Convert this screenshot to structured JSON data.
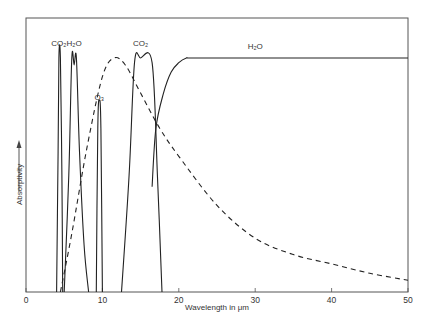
{
  "chart_data": {
    "type": "line",
    "title": "",
    "xlabel": "Wavelength in μm",
    "ylabel": "Absorptivity",
    "xlim": [
      0,
      50
    ],
    "ylim": [
      0,
      1.15
    ],
    "x_ticks": [
      "0",
      "10",
      "20",
      "30",
      "40",
      "50"
    ],
    "grid": false,
    "legend": "none (bands annotated directly)",
    "annotations": [
      {
        "text": "CO₂",
        "x": 4.3,
        "y": 1.05
      },
      {
        "text": "H₂O",
        "x": 6.3,
        "y": 1.05
      },
      {
        "text": "O₃",
        "x": 9.6,
        "y": 0.82
      },
      {
        "text": "CO₂",
        "x": 15.0,
        "y": 1.05
      },
      {
        "text": "H₂O",
        "x": 30,
        "y": 1.04
      }
    ],
    "series": [
      {
        "name": "CO2 band (4.3 μm)",
        "style": "solid",
        "x": [
          4.0,
          4.2,
          4.3,
          4.5,
          4.7,
          4.8
        ],
        "y": [
          0,
          0.6,
          1.0,
          1.0,
          0.5,
          0
        ]
      },
      {
        "name": "H2O band (6.3 μm)",
        "style": "solid",
        "x": [
          5.0,
          5.6,
          6.0,
          6.3,
          6.6,
          7.0,
          7.6,
          8.2
        ],
        "y": [
          0,
          0.5,
          1.0,
          0.97,
          1.0,
          0.6,
          0.2,
          0
        ]
      },
      {
        "name": "O3 band (9.6 μm)",
        "style": "solid",
        "x": [
          9.2,
          9.4,
          9.6,
          9.8,
          10.0
        ],
        "y": [
          0,
          0.7,
          0.82,
          0.7,
          0
        ]
      },
      {
        "name": "CO2 band (15 μm)",
        "style": "solid",
        "x": [
          12.5,
          13.5,
          14.2,
          15.0,
          16.5,
          17.2,
          17.8
        ],
        "y": [
          0,
          0.5,
          0.98,
          1.0,
          0.98,
          0.5,
          0
        ]
      },
      {
        "name": "H2O rotation band",
        "style": "solid",
        "x": [
          16.5,
          17.0,
          18.0,
          19.0,
          20.0,
          21.0,
          22.0,
          30,
          40,
          50
        ],
        "y": [
          0.45,
          0.7,
          0.85,
          0.94,
          0.98,
          1.0,
          1.0,
          1.0,
          1.0,
          1.0
        ]
      },
      {
        "name": "Terrestrial emission (Planck curve)",
        "style": "dashed",
        "x": [
          4.5,
          6,
          8,
          10,
          11.5,
          13,
          15,
          17.5,
          20,
          25,
          30,
          35,
          40,
          45,
          50
        ],
        "y": [
          0,
          0.25,
          0.62,
          0.92,
          1.0,
          0.97,
          0.85,
          0.7,
          0.58,
          0.37,
          0.23,
          0.16,
          0.12,
          0.08,
          0.05
        ]
      }
    ]
  }
}
